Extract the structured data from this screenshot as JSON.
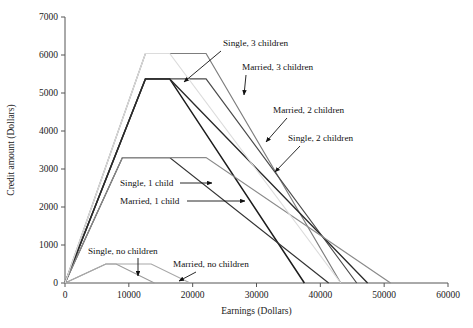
{
  "chart_data": {
    "type": "line",
    "title": "",
    "xlabel": "Earnings (Dollars)",
    "ylabel": "Credit amount (Dollars)",
    "xlim": [
      0,
      60000
    ],
    "ylim": [
      0,
      7000
    ],
    "xticks": [
      0,
      10000,
      20000,
      30000,
      40000,
      50000,
      60000
    ],
    "yticks": [
      0,
      1000,
      2000,
      3000,
      4000,
      5000,
      6000,
      7000
    ],
    "xtick_labels": [
      "0",
      "10000",
      "20000",
      "30000",
      "40000",
      "50000",
      "60000"
    ],
    "ytick_labels": [
      "0",
      "1000",
      "2000",
      "3000",
      "4000",
      "5000",
      "6000",
      "7000"
    ],
    "grid": false,
    "legend_position": "none",
    "series": [
      {
        "name": "Single, 3 children",
        "color": "#1c1c1c",
        "width": 1.5,
        "x": [
          0,
          12600,
          16400,
          37500
        ],
        "y": [
          0,
          5370,
          5370,
          0
        ]
      },
      {
        "name": "Married, 3 children",
        "color": "#7d7d7d",
        "width": 1.2,
        "x": [
          0,
          12600,
          22100,
          43200
        ],
        "y": [
          0,
          6040,
          6040,
          0
        ]
      },
      {
        "name": "Married, 2 children",
        "color": "#4a4a4a",
        "width": 1.2,
        "x": [
          0,
          12600,
          22100,
          45700
        ],
        "y": [
          0,
          5370,
          5370,
          0
        ]
      },
      {
        "name": "Single, 2 children",
        "color": "#2a2a2a",
        "width": 1.3,
        "x": [
          0,
          12600,
          16400,
          47400
        ],
        "y": [
          0,
          5370,
          5370,
          0
        ]
      },
      {
        "name": "Single, 1 child",
        "color": "#333333",
        "width": 1.2,
        "x": [
          0,
          9000,
          16400,
          41300
        ],
        "y": [
          0,
          3300,
          3300,
          0
        ]
      },
      {
        "name": "Married, 1 child",
        "color": "#8a8a8a",
        "width": 1.2,
        "x": [
          0,
          9000,
          22100,
          51000
        ],
        "y": [
          0,
          3300,
          3300,
          0
        ]
      },
      {
        "name": "Single, no children",
        "color": "#9a9a9a",
        "width": 1.1,
        "x": [
          0,
          6400,
          8000,
          14000
        ],
        "y": [
          0,
          500,
          500,
          0
        ]
      },
      {
        "name": "Married, no children",
        "color": "#a8a8a8",
        "width": 1.1,
        "x": [
          0,
          6400,
          13500,
          19600
        ],
        "y": [
          0,
          500,
          500,
          0
        ]
      },
      {
        "name": "Single, 3 children faint",
        "color": "#dcdcdc",
        "width": 1.2,
        "x": [
          0,
          12600,
          16400,
          43200
        ],
        "y": [
          0,
          6040,
          6040,
          0
        ]
      }
    ],
    "annotations": [
      {
        "label": "Single, 3 children",
        "text_x": 223,
        "text_y": 46,
        "arrow": [
          [
            221,
            51
          ],
          [
            184,
            82
          ]
        ]
      },
      {
        "label": "Married, 3 children",
        "text_x": 242,
        "text_y": 70,
        "arrow": [
          [
            246,
            75
          ],
          [
            244,
            95
          ]
        ]
      },
      {
        "label": "Married, 2 children",
        "text_x": 273,
        "text_y": 113,
        "arrow": [
          [
            287,
            118
          ],
          [
            266,
            142
          ]
        ]
      },
      {
        "label": "Single, 2 children",
        "text_x": 288,
        "text_y": 141,
        "arrow": [
          [
            300,
            146
          ],
          [
            275,
            172
          ]
        ]
      },
      {
        "label": "Single, 1 child",
        "text_x": 120,
        "text_y": 186,
        "arrow": [
          [
            180,
            183
          ],
          [
            212,
            183
          ]
        ]
      },
      {
        "label": "Married, 1 child",
        "text_x": 120,
        "text_y": 204,
        "arrow": [
          [
            187,
            201
          ],
          [
            245,
            201
          ]
        ]
      },
      {
        "label": "Single, no children",
        "text_x": 88,
        "text_y": 254,
        "arrow": [
          [
            138,
            258
          ],
          [
            138,
            276
          ]
        ]
      },
      {
        "label": "Married, no children",
        "text_x": 173,
        "text_y": 267,
        "arrow": [
          [
            196,
            272
          ],
          [
            179,
            281
          ]
        ]
      }
    ]
  }
}
